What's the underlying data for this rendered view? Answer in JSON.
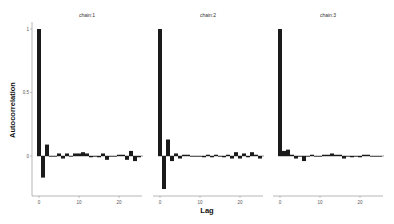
{
  "chart_data": {
    "type": "bar",
    "title": "",
    "xlabel": "Lag",
    "ylabel": "Autocorrelation",
    "ylim": [
      -0.45,
      1.0
    ],
    "yticks": [
      0,
      0.5,
      1
    ],
    "xticks": [
      0,
      10,
      20
    ],
    "grid": false,
    "panels": [
      {
        "name": "chain:1",
        "lags": [
          0,
          1,
          2,
          3,
          4,
          5,
          6,
          7,
          8,
          9,
          10,
          11,
          12,
          13,
          14,
          15,
          16,
          17,
          18,
          19,
          20,
          21,
          22,
          23,
          24,
          25
        ],
        "values": [
          1.0,
          -0.17,
          0.09,
          0.0,
          0.0,
          0.02,
          -0.02,
          0.02,
          0.0,
          0.02,
          0.02,
          0.03,
          0.02,
          -0.01,
          0.0,
          -0.01,
          0.02,
          -0.03,
          0.0,
          0.0,
          0.01,
          0.01,
          -0.03,
          0.04,
          -0.04,
          -0.01
        ]
      },
      {
        "name": "chain:2",
        "lags": [
          0,
          1,
          2,
          3,
          4,
          5,
          6,
          7,
          8,
          9,
          10,
          11,
          12,
          13,
          14,
          15,
          16,
          17,
          18,
          19,
          20,
          21,
          22,
          23,
          24,
          25
        ],
        "values": [
          1.0,
          -0.26,
          0.13,
          -0.04,
          0.02,
          -0.02,
          0.01,
          0.01,
          0.0,
          0.0,
          0.0,
          -0.01,
          0.01,
          -0.01,
          0.01,
          0.0,
          -0.01,
          0.01,
          -0.02,
          0.03,
          -0.02,
          0.02,
          -0.01,
          0.03,
          0.01,
          -0.02
        ]
      },
      {
        "name": "chain:3",
        "lags": [
          0,
          1,
          2,
          3,
          4,
          5,
          6,
          7,
          8,
          9,
          10,
          11,
          12,
          13,
          14,
          15,
          16,
          17,
          18,
          19,
          20,
          21,
          22,
          23,
          24,
          25
        ],
        "values": [
          1.0,
          0.04,
          0.05,
          0.01,
          -0.02,
          0.0,
          -0.04,
          0.0,
          0.01,
          0.0,
          0.0,
          0.01,
          0.01,
          0.02,
          0.01,
          0.01,
          -0.02,
          0.0,
          -0.01,
          0.0,
          -0.01,
          0.01,
          0.01,
          0.0,
          0.0,
          0.0
        ]
      }
    ]
  },
  "labels": {
    "xlabel": "Lag",
    "ylabel": "Autocorrelation",
    "panel_titles": [
      "chain:1",
      "chain:2",
      "chain:3"
    ],
    "yticks": [
      "0",
      "0.5",
      "1"
    ],
    "xticks": [
      "0",
      "10",
      "20"
    ]
  },
  "colors": {
    "bar": "#1a1a1a",
    "axis": "#888888"
  }
}
